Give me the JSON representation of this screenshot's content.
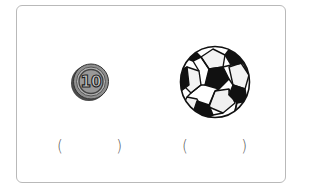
{
  "card": {
    "border_color": "#b9b9b9"
  },
  "items": [
    {
      "name": "coin",
      "icon": "ten-coin-icon",
      "coin_label": "10",
      "answer": {
        "open_paren": "(",
        "value": "",
        "close_paren": ")"
      }
    },
    {
      "name": "soccer-ball",
      "icon": "soccer-ball-icon",
      "answer": {
        "open_paren": "(",
        "value": "",
        "close_paren": ")"
      }
    }
  ],
  "colors": {
    "coin_face": "#9a9a9a",
    "coin_rim": "#5a5a5a",
    "ball_dark": "#111111",
    "ball_light": "#ffffff"
  }
}
